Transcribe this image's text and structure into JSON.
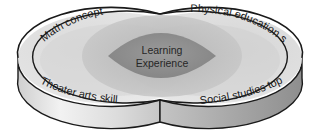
{
  "diagram": {
    "type": "venn-3d-cylinders",
    "center_label": {
      "line1": "Learning",
      "line2": "Experience"
    },
    "outer_labels": {
      "top_left": "Math concept",
      "top_right": "Physical education skill",
      "bottom_left": "Theater arts skill",
      "bottom_right": "Social studies topic"
    },
    "colors": {
      "outline": "#1a1a1a",
      "top_face_light": "#e6e6e6",
      "top_face_mid": "#d2d2d2",
      "halo": "#b9b9b9",
      "intersection": "#8f8f8f",
      "side_band_left": "#d8d8d8",
      "side_band_right": "#9f9f9f",
      "text": "#1a1a1a"
    }
  }
}
